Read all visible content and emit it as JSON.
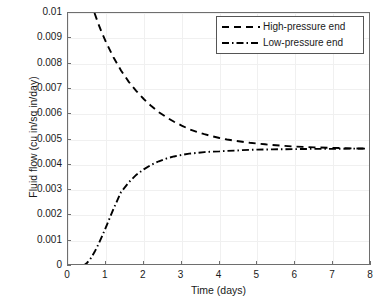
{
  "chart_data": {
    "type": "line",
    "title": "",
    "xlabel": "Time (days)",
    "ylabel": "Fluid flow (cu in/sq in/day)",
    "xlim": [
      0,
      8
    ],
    "ylim": [
      0,
      0.01
    ],
    "grid": true,
    "legend_position": "top-right",
    "xticks": [
      "0",
      "1",
      "2",
      "3",
      "4",
      "5",
      "6",
      "7",
      "8"
    ],
    "xtick_values": [
      0,
      1,
      2,
      3,
      4,
      5,
      6,
      7,
      8
    ],
    "yticks": [
      "0",
      "0.001",
      "0.002",
      "0.003",
      "0.004",
      "0.005",
      "0.006",
      "0.007",
      "0.008",
      "0.009",
      "0.01"
    ],
    "ytick_values": [
      0,
      0.001,
      0.002,
      0.003,
      0.004,
      0.005,
      0.006,
      0.007,
      0.008,
      0.009,
      0.01
    ],
    "series": [
      {
        "name": "High-pressure end",
        "linestyle": "dashed",
        "color": "#000000",
        "x": [
          0.7,
          0.8,
          0.9,
          1.0,
          1.2,
          1.4,
          1.6,
          1.8,
          2.0,
          2.2,
          2.4,
          2.6,
          2.8,
          3.0,
          3.2,
          3.4,
          3.6,
          3.8,
          4.0,
          4.2,
          4.4,
          4.6,
          4.8,
          5.0,
          5.2,
          5.4,
          5.6,
          6.0,
          6.5,
          7.0,
          7.5,
          7.9
        ],
        "y": [
          0.01,
          0.00958,
          0.0092,
          0.00886,
          0.00825,
          0.00773,
          0.00729,
          0.00692,
          0.0066,
          0.00632,
          0.00608,
          0.00588,
          0.0057,
          0.00555,
          0.00541,
          0.0053,
          0.00521,
          0.00513,
          0.00506,
          0.005,
          0.00495,
          0.00491,
          0.00487,
          0.00484,
          0.00481,
          0.00478,
          0.00476,
          0.00472,
          0.00469,
          0.00467,
          0.00465,
          0.00464
        ]
      },
      {
        "name": "Low-pressure end",
        "linestyle": "dash-dot",
        "color": "#000000",
        "x": [
          0.4,
          0.5,
          0.6,
          0.7,
          0.8,
          0.9,
          1.0,
          1.2,
          1.4,
          1.6,
          1.8,
          2.0,
          2.2,
          2.4,
          2.6,
          2.8,
          3.0,
          3.2,
          3.4,
          3.6,
          3.8,
          4.0,
          4.2,
          4.4,
          4.6,
          4.8,
          5.0,
          5.4,
          6.0,
          6.5,
          7.0,
          7.5,
          7.9
        ],
        "y": [
          0.0,
          0.00012,
          0.0003,
          0.00055,
          0.00085,
          0.00118,
          0.00153,
          0.00225,
          0.00292,
          0.0033,
          0.0036,
          0.00382,
          0.004,
          0.00414,
          0.00425,
          0.00433,
          0.00439,
          0.00444,
          0.00447,
          0.0045,
          0.00452,
          0.00453,
          0.00455,
          0.00456,
          0.00458,
          0.00459,
          0.0046,
          0.00461,
          0.00462,
          0.00463,
          0.00463,
          0.00464,
          0.00464
        ]
      }
    ]
  },
  "legend": {
    "entries": [
      {
        "label": "High-pressure end",
        "style": "dashed"
      },
      {
        "label": "Low-pressure end",
        "style": "dash-dot"
      }
    ]
  }
}
